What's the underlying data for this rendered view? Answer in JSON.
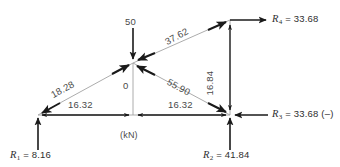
{
  "diagram": {
    "units_note": "(kN)",
    "colors": {
      "member_line": "#9a9a9a",
      "force_arrow": "#1a1a1a",
      "thin_arrow": "#1a1a1a",
      "text": "#3a3a3a",
      "background": "#ffffff"
    },
    "members": [
      {
        "id": "left-diagonal",
        "label": "18.28",
        "x1": 38,
        "y1": 115,
        "x2": 133,
        "y2": 63
      },
      {
        "id": "right-diagonal",
        "label": "55.90",
        "x1": 133,
        "y1": 63,
        "x2": 230,
        "y2": 115
      },
      {
        "id": "top-chord",
        "label": "37.62",
        "x1": 133,
        "y1": 63,
        "x2": 230,
        "y2": 20
      },
      {
        "id": "bottom-chord-left",
        "label": "16.32",
        "x1": 38,
        "y1": 115,
        "x2": 133,
        "y2": 115
      },
      {
        "id": "bottom-chord-right",
        "label": "16.32",
        "x1": 133,
        "y1": 115,
        "x2": 230,
        "y2": 115
      },
      {
        "id": "center-vertical",
        "label": "0",
        "x1": 133,
        "y1": 63,
        "x2": 133,
        "y2": 115
      },
      {
        "id": "right-vertical",
        "label": "16.84",
        "x1": 230,
        "y1": 20,
        "x2": 230,
        "y2": 115
      }
    ],
    "applied_load": {
      "id": "load-50",
      "label": "50",
      "direction": "down",
      "at_joint": "apex"
    },
    "reactions": [
      {
        "id": "R1",
        "symbol": "R",
        "subscript": "1",
        "value": "8.16",
        "text": "R₁ = 8.16",
        "direction": "up",
        "at_joint": "left-support"
      },
      {
        "id": "R2",
        "symbol": "R",
        "subscript": "2",
        "value": "41.84",
        "text": "R₂ = 41.84",
        "direction": "up",
        "at_joint": "right-support"
      },
      {
        "id": "R3",
        "symbol": "R",
        "subscript": "3",
        "value": "33.68 (–)",
        "text": "R₃ = 33.68 (–)",
        "direction": "left",
        "at_joint": "right-support"
      },
      {
        "id": "R4",
        "symbol": "R",
        "subscript": "4",
        "value": "33.68",
        "text": "R₄ = 33.68",
        "direction": "right",
        "at_joint": "right-top"
      }
    ],
    "joints": [
      {
        "id": "left-support",
        "x": 38,
        "y": 115
      },
      {
        "id": "apex",
        "x": 133,
        "y": 63
      },
      {
        "id": "right-support",
        "x": 230,
        "y": 115
      },
      {
        "id": "right-top",
        "x": 230,
        "y": 20
      }
    ],
    "labels": {
      "m_left_diagonal": "18.28",
      "m_right_diagonal": "55.90",
      "m_top_chord": "37.62",
      "m_bottom_left": "16.32",
      "m_bottom_right": "16.32",
      "m_center_vertical": "0",
      "m_right_vertical": "16.84",
      "load": "50",
      "units": "(kN)",
      "r1_sym": "R",
      "r1_sub": "1",
      "r1_val": " = 8.16",
      "r2_sym": "R",
      "r2_sub": "2",
      "r2_val": " = 41.84",
      "r3_sym": "R",
      "r3_sub": "3",
      "r3_val": " = 33.68 (–)",
      "r4_sym": "R",
      "r4_sub": "4",
      "r4_val": " = 33.68"
    }
  }
}
